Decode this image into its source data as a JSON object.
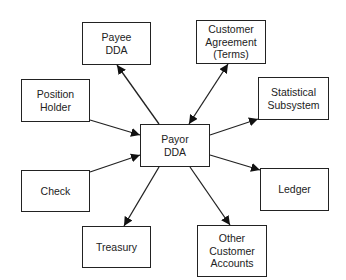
{
  "diagram": {
    "center": {
      "id": "payor",
      "label": "Payor\nDDA"
    },
    "nodes": [
      {
        "id": "payee",
        "label": "Payee\nDDA"
      },
      {
        "id": "agreement",
        "label": "Customer\nAgreement\n(Terms)"
      },
      {
        "id": "position",
        "label": "Position\nHolder"
      },
      {
        "id": "statistical",
        "label": "Statistical\nSubsystem"
      },
      {
        "id": "check",
        "label": "Check"
      },
      {
        "id": "ledger",
        "label": "Ledger"
      },
      {
        "id": "treasury",
        "label": "Treasury"
      },
      {
        "id": "other",
        "label": "Other\nCustomer\nAccounts"
      }
    ],
    "edges": [
      {
        "from": "payor",
        "to": "payee",
        "direction": "to"
      },
      {
        "from": "payor",
        "to": "agreement",
        "direction": "both"
      },
      {
        "from": "position",
        "to": "payor",
        "direction": "to"
      },
      {
        "from": "payor",
        "to": "statistical",
        "direction": "to"
      },
      {
        "from": "check",
        "to": "payor",
        "direction": "to"
      },
      {
        "from": "payor",
        "to": "ledger",
        "direction": "to"
      },
      {
        "from": "payor",
        "to": "treasury",
        "direction": "to"
      },
      {
        "from": "payor",
        "to": "other",
        "direction": "to"
      }
    ]
  }
}
